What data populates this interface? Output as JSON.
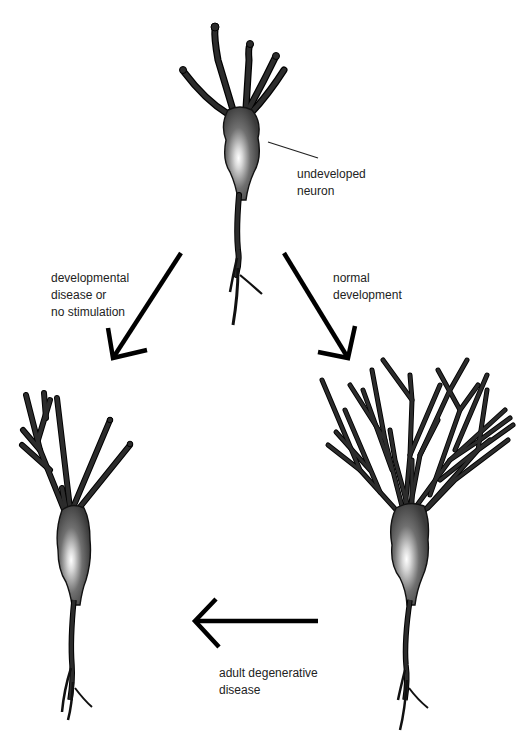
{
  "diagram": {
    "type": "neuron-development-flow",
    "nodes": [
      {
        "id": "undeveloped",
        "label": "undeveloped\nneuron",
        "description": "simple neuron with few short dendrites"
      },
      {
        "id": "stunted",
        "label": "",
        "description": "neuron with sparse, poorly branched dendrites"
      },
      {
        "id": "developed",
        "label": "",
        "description": "neuron with richly branched dendritic tree"
      }
    ],
    "edges": [
      {
        "from": "undeveloped",
        "to": "stunted",
        "label": "developmental\ndisease or\nno stimulation"
      },
      {
        "from": "undeveloped",
        "to": "developed",
        "label": "normal\ndevelopment"
      },
      {
        "from": "developed",
        "to": "stunted",
        "label": "adult degenerative\ndisease"
      }
    ]
  },
  "labels": {
    "undeveloped": "undeveloped\nneuron",
    "left_arrow": "developmental\ndisease or\nno stimulation",
    "right_arrow": "normal\ndevelopment",
    "bottom_arrow": "adult degenerative\ndisease"
  },
  "colors": {
    "background": "#ffffff",
    "neuron_dark": "#2c2c2c",
    "neuron_highlight": "#ffffff",
    "arrow": "#000000",
    "text": "#222222"
  }
}
